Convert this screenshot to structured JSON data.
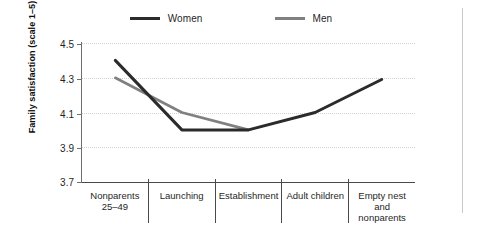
{
  "legend": {
    "items": [
      {
        "label": "Women",
        "color": "#2b2b2b"
      },
      {
        "label": "Men",
        "color": "#808080"
      }
    ]
  },
  "axes": {
    "y_title": "Family satisfaction (scale 1–5)",
    "y_ticks": [
      "4.5",
      "4.3",
      "4.1",
      "3.9",
      "3.7"
    ]
  },
  "categories": [
    {
      "line1": "Nonparents",
      "line2": "25–49"
    },
    {
      "line1": "Launching",
      "line2": ""
    },
    {
      "line1": "Establishment",
      "line2": ""
    },
    {
      "line1": "Adult children",
      "line2": ""
    },
    {
      "line1": "Empty nest and",
      "line2": "nonparents 50+"
    }
  ],
  "chart_data": {
    "type": "line",
    "title": "",
    "xlabel": "",
    "ylabel": "Family satisfaction (scale 1–5)",
    "categories": [
      "Nonparents 25–49",
      "Launching",
      "Establishment",
      "Adult children",
      "Empty nest and nonparents 50+"
    ],
    "series": [
      {
        "name": "Women",
        "color": "#2b2b2b",
        "values": [
          4.4,
          4.0,
          4.0,
          4.1,
          4.29
        ]
      },
      {
        "name": "Men",
        "color": "#808080",
        "values": [
          4.3,
          4.1,
          4.0,
          null,
          null
        ]
      }
    ],
    "ylim": [
      3.7,
      4.5
    ],
    "ytick_step": 0.2,
    "grid": true,
    "legend_position": "top-center"
  }
}
